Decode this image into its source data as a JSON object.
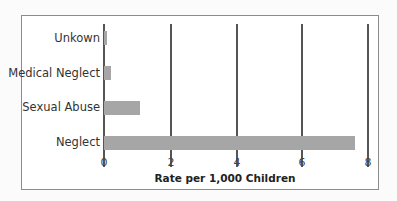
{
  "chart_data": {
    "type": "bar",
    "orientation": "horizontal",
    "title": "",
    "xlabel": "Rate per 1,000 Children",
    "ylabel": "",
    "categories": [
      "Unkown",
      "Medical Neglect",
      "Sexual Abuse",
      "Neglect"
    ],
    "values": [
      0.1,
      0.2,
      1.1,
      7.6
    ],
    "xlim": [
      0,
      8
    ],
    "xticks": [
      "0",
      "2",
      "4",
      "6",
      "8"
    ],
    "grid": true,
    "legend": null,
    "bar_color": "#a6a6a6"
  }
}
